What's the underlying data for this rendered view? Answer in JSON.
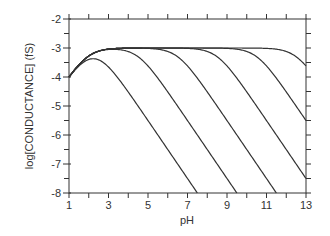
{
  "chart_data": {
    "type": "line",
    "title": "",
    "xlabel": "pH",
    "ylabel": "log[CONDUCTANCE] (fS)",
    "xlim": [
      1,
      13
    ],
    "ylim": [
      -8,
      -2
    ],
    "x_ticks": [
      1,
      3,
      5,
      7,
      9,
      11,
      13
    ],
    "x_tick_labels": [
      "1",
      "3",
      "5",
      "7",
      "9",
      "11",
      "13"
    ],
    "x_minor_step": 1,
    "y_ticks": [
      -2,
      -3,
      -4,
      -5,
      -6,
      -7,
      -8
    ],
    "y_tick_labels": [
      "-2",
      "-3",
      "-4",
      "-5",
      "-6",
      "-7",
      "-8"
    ],
    "y_minor_step": 0.5,
    "grid": false,
    "legend": null,
    "model": "log G = -3 + log10( 1/(1+10^(1.95-pH)) * 1/(1+10^(pH-b)) )",
    "series": [
      {
        "name": "curve-1",
        "b": 2.5,
        "peak": {
          "x": 2.3,
          "y": -3.4
        },
        "points": [
          [
            1,
            -4.0
          ],
          [
            2.3,
            -3.4
          ],
          [
            4.6,
            -5.0
          ],
          [
            7.5,
            -8.0
          ]
        ]
      },
      {
        "name": "curve-2",
        "b": 4.5,
        "points": [
          [
            1,
            -4.0
          ],
          [
            3,
            -3.05
          ],
          [
            5,
            -3.65
          ],
          [
            7.5,
            -6.0
          ],
          [
            9.5,
            -8.0
          ]
        ]
      },
      {
        "name": "curve-3",
        "b": 6.5,
        "points": [
          [
            1,
            -4.0
          ],
          [
            3,
            -3.05
          ],
          [
            6,
            -3.1
          ],
          [
            9.5,
            -6.0
          ],
          [
            11.5,
            -8.0
          ]
        ]
      },
      {
        "name": "curve-4",
        "b": 8.5,
        "points": [
          [
            1,
            -4.0
          ],
          [
            3,
            -3.05
          ],
          [
            8,
            -3.1
          ],
          [
            11.5,
            -6.0
          ],
          [
            13,
            -7.5
          ]
        ]
      },
      {
        "name": "curve-5",
        "b": 10.5,
        "points": [
          [
            1,
            -4.0
          ],
          [
            3,
            -3.05
          ],
          [
            10,
            -3.1
          ],
          [
            13,
            -5.5
          ]
        ]
      },
      {
        "name": "curve-6",
        "b": 12.5,
        "points": [
          [
            1,
            -4.0
          ],
          [
            3,
            -3.05
          ],
          [
            12,
            -3.1
          ],
          [
            13,
            -3.6
          ]
        ]
      }
    ],
    "colors": {
      "line": "#333333",
      "background": "#ffffff"
    }
  },
  "axes": {
    "x_title": "pH",
    "y_title": "log[CONDUCTANCE] (fS)"
  }
}
